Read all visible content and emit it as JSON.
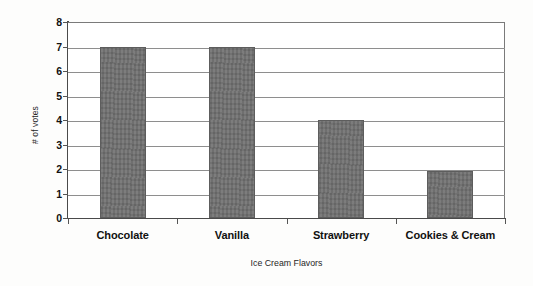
{
  "chart_data": {
    "type": "bar",
    "title": "",
    "categories": [
      "Chocolate",
      "Vanilla",
      "Strawberry",
      "Cookies & Cream"
    ],
    "values": [
      7,
      7,
      4,
      1.9
    ],
    "xlabel": "Ice Cream Flavors",
    "ylabel": "# of votes",
    "ylim": [
      0,
      8
    ],
    "ytick_labels": [
      "8",
      "7",
      "6",
      "5",
      "4",
      "3",
      "2",
      "1",
      "0"
    ],
    "ytick_values": [
      8,
      7,
      6,
      5,
      4,
      3,
      2,
      1,
      0
    ],
    "grid": "horizontal",
    "legend": "none",
    "series": [
      {
        "name": "# of votes",
        "values": [
          7,
          7,
          4,
          1.9
        ],
        "color": "#6f6f6f"
      }
    ]
  },
  "colors": {
    "bar_fill": "#6f6f6f",
    "bar_border": "#5d5d5d",
    "gridline": "#8e8e8e",
    "axis_line": "#4a4a4a",
    "plot_background": "#ffffff",
    "figure_background": "#fdfdfc",
    "text": "#111111"
  }
}
